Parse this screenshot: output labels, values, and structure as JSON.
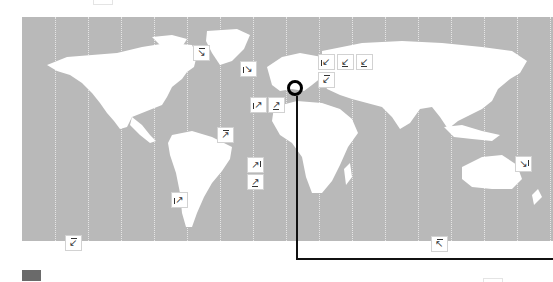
{
  "map": {
    "projection": "equirectangular-world",
    "colors": {
      "ocean": "#b9b9b9",
      "land": "#ffffff",
      "meridian": "#e6e6e6",
      "marker_bg": "#ffffff",
      "marker_border": "#d2d2d2",
      "pin": "#000000",
      "legend_swatch": "#6a6a6a"
    },
    "meridian_x": [
      55,
      88,
      121,
      154,
      187,
      220,
      253,
      286,
      319,
      352,
      385,
      418,
      451,
      484,
      517,
      550
    ]
  },
  "markers": [
    {
      "id": "m1",
      "region": "north-atlantic-greenland-west",
      "icon": "arrow-down-right-icon",
      "glyph": "↘",
      "decor": "top",
      "x": 193,
      "y": 45
    },
    {
      "id": "m2",
      "region": "greenland-east",
      "icon": "arrow-down-right-icon",
      "glyph": "↘",
      "decor": "left",
      "x": 240,
      "y": 61
    },
    {
      "id": "m3",
      "region": "north-atlantic-east",
      "icon": "arrow-up-right-icon",
      "glyph": "↗",
      "decor": "left",
      "x": 250,
      "y": 97
    },
    {
      "id": "m4",
      "region": "iberia",
      "icon": "arrow-up-right-icon",
      "glyph": "↗",
      "decor": "bottom",
      "x": 268,
      "y": 97
    },
    {
      "id": "m5",
      "region": "scandinavia-1",
      "icon": "arrow-down-left-icon",
      "glyph": "↙",
      "decor": "left",
      "x": 318,
      "y": 54
    },
    {
      "id": "m6",
      "region": "scandinavia-2",
      "icon": "arrow-down-left-icon",
      "glyph": "↙",
      "decor": "bottom",
      "x": 337,
      "y": 54
    },
    {
      "id": "m7",
      "region": "russia-west",
      "icon": "arrow-down-left-icon",
      "glyph": "↙",
      "decor": "bottom",
      "x": 356,
      "y": 54
    },
    {
      "id": "m8",
      "region": "baltic",
      "icon": "arrow-down-left-icon",
      "glyph": "↙",
      "decor": "top",
      "x": 318,
      "y": 72
    },
    {
      "id": "m9",
      "region": "brazil-north",
      "icon": "arrow-up-right-icon",
      "glyph": "↗",
      "decor": "top",
      "x": 217,
      "y": 127
    },
    {
      "id": "m10",
      "region": "south-atlantic-1",
      "icon": "arrow-up-right-icon",
      "glyph": "↗",
      "decor": "right",
      "x": 247,
      "y": 157
    },
    {
      "id": "m11",
      "region": "south-atlantic-2",
      "icon": "arrow-up-right-icon",
      "glyph": "↗",
      "decor": "bottom",
      "x": 247,
      "y": 174
    },
    {
      "id": "m12",
      "region": "patagonia",
      "icon": "arrow-up-right-icon",
      "glyph": "↗",
      "decor": "left",
      "x": 171,
      "y": 192
    },
    {
      "id": "m13",
      "region": "pacific-southeast",
      "icon": "arrow-down-left-icon",
      "glyph": "↙",
      "decor": "top",
      "x": 65,
      "y": 235
    },
    {
      "id": "m14",
      "region": "southern-ocean",
      "icon": "arrow-up-left-icon",
      "glyph": "↖",
      "decor": "top",
      "x": 431,
      "y": 236
    },
    {
      "id": "m15",
      "region": "melanesia",
      "icon": "arrow-down-right-icon",
      "glyph": "↘",
      "decor": "right",
      "x": 515,
      "y": 156
    }
  ],
  "pin": {
    "icon": "location-ring-icon",
    "region": "central-europe",
    "x": 295,
    "y": 88
  },
  "legend": {
    "swatch_label": ""
  }
}
